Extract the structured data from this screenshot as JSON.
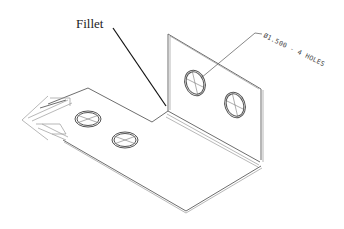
{
  "figure": {
    "labels": {
      "fillet": "Fillet",
      "hole_note": "Ø1.500 - 4 HOLES"
    },
    "parts": {
      "vertical_flange": {
        "holes": 2
      },
      "base_plate": {
        "holes": 2
      },
      "bend": "fillet"
    },
    "colors": {
      "background": "#ffffff",
      "line": "#6e6e6e",
      "leader": "#111111"
    }
  }
}
